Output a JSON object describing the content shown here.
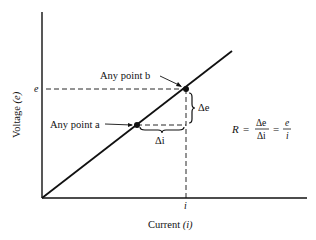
{
  "diagram": {
    "axes": {
      "x_label": "Current (i)",
      "x_label_text": "Current ",
      "x_label_var": "(i)",
      "y_label_text": "Voltage ",
      "y_label_var": "(e)",
      "x_tick": "i",
      "y_tick": "e"
    },
    "points": {
      "a": {
        "label": "Any point a"
      },
      "b": {
        "label": "Any point b"
      }
    },
    "deltas": {
      "delta_i": "Δi",
      "delta_e": "Δe"
    },
    "formula": {
      "lhs": "R",
      "eq1": "=",
      "frac1_num": "Δe",
      "frac1_den": "Δi",
      "eq2": "=",
      "frac2_num": "e",
      "frac2_den": "i"
    },
    "colors": {
      "ink": "#111111",
      "background": "#ffffff"
    }
  }
}
